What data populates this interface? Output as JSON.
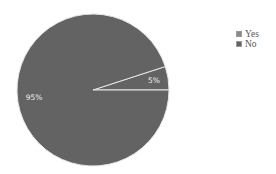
{
  "chart_data": {
    "type": "pie",
    "title": "",
    "categories": [
      "Yes",
      "No"
    ],
    "values": [
      5,
      95
    ],
    "labels": [
      "5%",
      "95%"
    ],
    "colors": [
      "#636363",
      "#636363"
    ],
    "separator_color": "#e6e6e6",
    "legend": {
      "position": "right",
      "entries": [
        {
          "label": "Yes",
          "color": "#8a8a8a"
        },
        {
          "label": "No",
          "color": "#636363"
        }
      ]
    },
    "start_angle_deg": 0,
    "direction": "counterclockwise"
  }
}
